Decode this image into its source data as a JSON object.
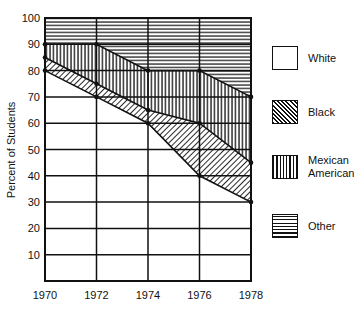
{
  "chart_data": {
    "type": "area",
    "stacked": true,
    "title": "",
    "xlabel": "",
    "ylabel": "Percent of Students",
    "x": [
      1970,
      1972,
      1974,
      1976,
      1978
    ],
    "x_tick_labels": [
      "1970",
      "1972",
      "1974",
      "1976",
      "1978"
    ],
    "y_tick_labels": [
      "10",
      "20",
      "30",
      "40",
      "50",
      "60",
      "70",
      "80",
      "90",
      "100"
    ],
    "ylim": [
      0,
      100
    ],
    "grid": true,
    "legend_position": "right",
    "series": [
      {
        "name": "White",
        "pattern": "blank",
        "values": [
          80,
          70,
          60,
          40,
          30
        ]
      },
      {
        "name": "Black",
        "pattern": "diagonal",
        "values": [
          5,
          5,
          5,
          20,
          15
        ]
      },
      {
        "name": "Mexican American",
        "pattern": "vertical",
        "values": [
          5,
          15,
          15,
          20,
          25
        ]
      },
      {
        "name": "Other",
        "pattern": "horizontal",
        "values": [
          10,
          10,
          20,
          20,
          30
        ]
      }
    ],
    "cumulative_boundaries": {
      "white_top": [
        80,
        70,
        60,
        40,
        30
      ],
      "black_top": [
        85,
        75,
        65,
        60,
        45
      ],
      "mexican_american_top": [
        90,
        90,
        80,
        80,
        70
      ],
      "other_top": [
        100,
        100,
        100,
        100,
        100
      ]
    }
  },
  "legend": {
    "items": [
      {
        "label": "White"
      },
      {
        "label": "Black"
      },
      {
        "label": "Mexican American",
        "line1": "Mexican",
        "line2": "American"
      },
      {
        "label": "Other"
      }
    ]
  }
}
